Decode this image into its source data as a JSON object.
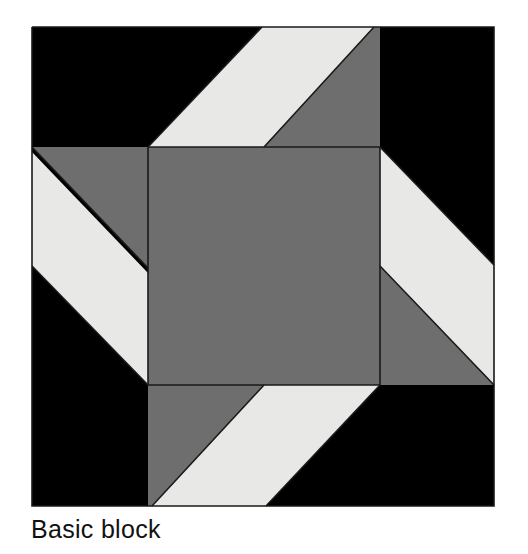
{
  "figure": {
    "caption": "Basic block",
    "background_color": "#ffffff"
  },
  "palette": {
    "background": "#ffffff",
    "dark": "#000000",
    "medium_gray": "#6e6e6e",
    "light": "#e8e8e6",
    "outline": "#1a1a1a"
  },
  "block": {
    "name": "Basic block",
    "bounds": {
      "x": 32,
      "y": 27,
      "width": 462,
      "height": 479
    },
    "center_square": {
      "x": 148,
      "y": 147,
      "width": 232,
      "height": 238,
      "color": "#6e6e6e"
    },
    "shapes": [
      {
        "name": "background-field",
        "color": "#000000",
        "points": "32,27 494,27 494,506 32,506"
      },
      {
        "name": "top-white-parallelogram",
        "color": "#e8e8e6",
        "points": "262,27 374,27 264,147 148,147"
      },
      {
        "name": "top-gray-triangle",
        "color": "#6e6e6e",
        "points": "374,27 380,27 380,147 264,147"
      },
      {
        "name": "left-gray-triangle",
        "color": "#6e6e6e",
        "points": "32,147 148,147 148,268"
      },
      {
        "name": "left-white-parallelogram",
        "color": "#e8e8e6",
        "points": "32,152 148,273 148,385 32,266"
      },
      {
        "name": "right-white-parallelogram",
        "color": "#e8e8e6",
        "points": "380,147 494,265 494,385 380,266"
      },
      {
        "name": "right-gray-triangle",
        "color": "#6e6e6e",
        "points": "380,266 494,385 380,385"
      },
      {
        "name": "bottom-gray-parallelogram",
        "color": "#6e6e6e",
        "points": "148,385 264,385 152,506 148,506"
      },
      {
        "name": "bottom-white-parallelogram",
        "color": "#e8e8e6",
        "points": "264,385 380,385 266,506 152,506"
      }
    ],
    "outlines": [
      {
        "name": "block-border",
        "points": "32,27 494,27 494,506 32,506 32,27"
      },
      {
        "name": "center-square-border",
        "points": "148,147 380,147 380,385 148,385 148,147"
      },
      {
        "name": "top-white-left-edge",
        "points": "148,147 262,27"
      },
      {
        "name": "top-white-right-edge",
        "points": "264,147 374,27"
      },
      {
        "name": "left-gray-hypotenuse",
        "points": "32,147 148,268"
      },
      {
        "name": "left-white-lower-edge",
        "points": "32,266 148,385"
      },
      {
        "name": "right-white-upper-edge",
        "points": "380,147 494,265"
      },
      {
        "name": "right-gray-hypotenuse",
        "points": "380,266 494,385"
      },
      {
        "name": "bottom-gray-hypotenuse",
        "points": "264,385 152,506"
      },
      {
        "name": "bottom-white-lower-edge",
        "points": "380,385 266,506"
      }
    ]
  }
}
